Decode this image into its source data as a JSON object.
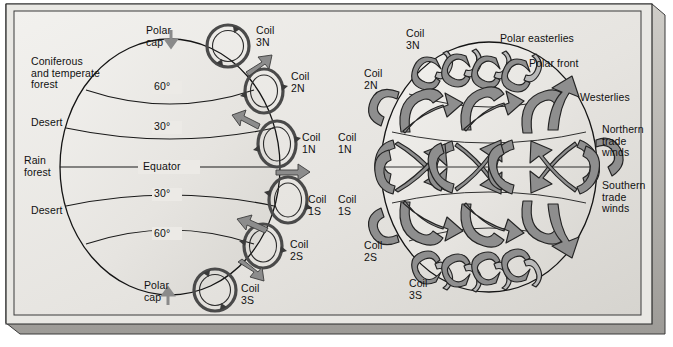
{
  "figure": {
    "title_hidden": "",
    "background_color": "#e9e8e4",
    "ribbon_color": "#8e8e8e",
    "line_color": "#1a1a1a"
  },
  "left_diagram": {
    "name": "globe-climate-zones-and-convection-coils",
    "biome_labels": [
      {
        "id": "coniferous",
        "text": "Coniferous\nand temperate\nforest"
      },
      {
        "id": "desert-north",
        "text": "Desert"
      },
      {
        "id": "rain-forest",
        "text": "Rain\nforest"
      },
      {
        "id": "desert-south",
        "text": "Desert"
      }
    ],
    "latitude_labels": [
      {
        "id": "lat-60n",
        "text": "60°"
      },
      {
        "id": "lat-30n",
        "text": "30°"
      },
      {
        "id": "equator",
        "text": "Equator"
      },
      {
        "id": "lat-30s",
        "text": "30°"
      },
      {
        "id": "lat-60s",
        "text": "60°"
      }
    ],
    "polar_caps": [
      {
        "id": "polar-cap-north",
        "text": "Polar\ncap",
        "arrow": "down"
      },
      {
        "id": "polar-cap-south",
        "text": "Polar\ncap",
        "arrow": "up"
      }
    ],
    "coil_labels": [
      {
        "id": "coil-3n",
        "text": "Coil\n3N"
      },
      {
        "id": "coil-2n",
        "text": "Coil\n2N"
      },
      {
        "id": "coil-1n",
        "text": "Coil\n1N"
      },
      {
        "id": "coil-1s",
        "text": "Coil\n1S"
      },
      {
        "id": "coil-2s",
        "text": "Coil\n2S"
      },
      {
        "id": "coil-3s",
        "text": "Coil\n3S"
      }
    ]
  },
  "right_diagram": {
    "name": "globe-global-wind-belts",
    "coil_labels": [
      {
        "id": "coil-3n",
        "text": "Coil\n3N"
      },
      {
        "id": "coil-2n",
        "text": "Coil\n2N"
      },
      {
        "id": "coil-1n",
        "text": "Coil\n1N"
      },
      {
        "id": "coil-1s",
        "text": "Coil\n1S"
      },
      {
        "id": "coil-2s",
        "text": "Coil\n2S"
      },
      {
        "id": "coil-3s",
        "text": "Coil\n3S"
      }
    ],
    "wind_labels": [
      {
        "id": "polar-easterlies",
        "text": "Polar easterlies"
      },
      {
        "id": "polar-front",
        "text": "Polar front"
      },
      {
        "id": "westerlies",
        "text": "Westerlies"
      },
      {
        "id": "northern-trade-winds",
        "text": "Northern\ntrade\nwinds"
      },
      {
        "id": "southern-trade-winds",
        "text": "Southern\ntrade\nwinds"
      }
    ]
  }
}
